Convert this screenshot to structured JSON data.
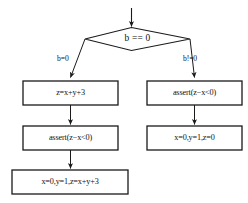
{
  "diagram": {
    "type": "control-flow-graph",
    "title": "",
    "colors": {
      "stroke": "#1a1a1a",
      "text": "#111111",
      "background": "#ffffff"
    },
    "entry": {
      "name": "entry-arrow",
      "label": ""
    },
    "decision": {
      "id": "decision-b-eq-0",
      "shape": "diamond",
      "label": "b == 0"
    },
    "edges": [
      {
        "id": "edge-true",
        "label": "b=0",
        "from": "decision-b-eq-0",
        "to": "left-box-1"
      },
      {
        "id": "edge-false",
        "label": "b!=0",
        "from": "decision-b-eq-0",
        "to": "right-box-1"
      },
      {
        "id": "edge-left-1-2",
        "label": "",
        "from": "left-box-1",
        "to": "left-box-2"
      },
      {
        "id": "edge-left-2-3",
        "label": "",
        "from": "left-box-2",
        "to": "left-box-3"
      },
      {
        "id": "edge-right-1-2",
        "label": "",
        "from": "right-box-1",
        "to": "right-box-2"
      }
    ],
    "nodes": {
      "left_branch": [
        {
          "id": "left-box-1",
          "shape": "rectangle",
          "label": "z=x+y+3"
        },
        {
          "id": "left-box-2",
          "shape": "rectangle",
          "label": "assert(z−x<0)"
        },
        {
          "id": "left-box-3",
          "shape": "rectangle",
          "label": "x=0,y=1,z=x+y+3"
        }
      ],
      "right_branch": [
        {
          "id": "right-box-1",
          "shape": "rectangle",
          "label": "assert(z−x<0)"
        },
        {
          "id": "right-box-2",
          "shape": "rectangle",
          "label": "x=0,y=1,z=0"
        }
      ]
    }
  }
}
